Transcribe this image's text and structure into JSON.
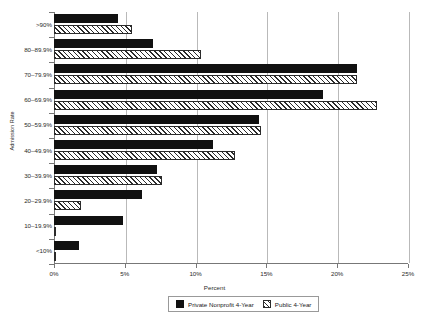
{
  "chart_data": {
    "type": "bar",
    "orientation": "horizontal",
    "title": "",
    "xlabel": "Percent",
    "ylabel": "Admission Rate",
    "xlim": [
      0,
      25
    ],
    "xticks": [
      "0%",
      "5%",
      "10%",
      "15%",
      "20%",
      "25%"
    ],
    "xtick_values": [
      0,
      5,
      10,
      15,
      20,
      25
    ],
    "grid": true,
    "legend_position": "bottom",
    "categories": [
      ">90%",
      "80–89.9%",
      "70–79.9%",
      "60–69.9%",
      "50–59.9%",
      "40–49.9%",
      "30–39.9%",
      "20–29.9%",
      "10–19.9%",
      "<10%"
    ],
    "series": [
      {
        "name": "Private Nonprofit 4-Year",
        "style": "solid-black",
        "color": "#111111",
        "values": [
          4.5,
          7.0,
          21.4,
          19.0,
          14.5,
          11.2,
          7.3,
          6.2,
          4.9,
          1.8
        ]
      },
      {
        "name": "Public 4-Year",
        "style": "hatched",
        "color": "#2b2b2b",
        "values": [
          5.5,
          10.4,
          21.4,
          22.8,
          14.6,
          12.8,
          7.6,
          1.9,
          0.15,
          0.1
        ]
      }
    ]
  }
}
